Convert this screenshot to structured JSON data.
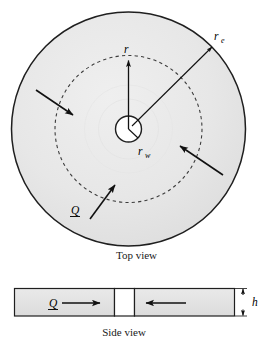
{
  "figure": {
    "title_top": "Top view",
    "title_side": "Side view",
    "labels": {
      "outer_radius": "r",
      "outer_radius_sub": "e",
      "well_radius": "r",
      "well_radius_sub": "w",
      "radius": "r",
      "flow_rate": "Q",
      "thickness": "h"
    },
    "colors": {
      "shade_fill": "#e4e4e4",
      "outline": "#1a1a1a",
      "dashed": "#3a3a3a",
      "white": "#ffffff"
    },
    "icons": {
      "inward_flow_arrow": "arrow-inward-icon",
      "flow_rate_arrow": "arrow-flow-icon",
      "dimension_arrow": "arrow-dimension-icon"
    }
  }
}
